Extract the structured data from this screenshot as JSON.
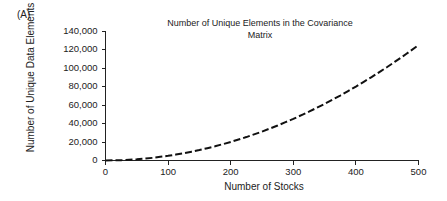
{
  "figure": {
    "panel_label": "(A)",
    "background_color": "#ffffff",
    "text_color": "#222222"
  },
  "chart_data": {
    "type": "line",
    "title": "Number of Unique Elements in the Covariance Matrix",
    "title_line1": "Number of Unique Elements in the Covariance",
    "title_line2": "Matrix",
    "xlabel": "Number of Stocks",
    "ylabel": "Number of Unique Data Elements",
    "xlim": [
      0,
      500
    ],
    "ylim": [
      0,
      140000
    ],
    "grid": false,
    "legend": "none",
    "line_style": "dashed",
    "line_color": "#111111",
    "x_ticks": [
      0,
      100,
      200,
      300,
      400,
      500
    ],
    "x_tick_labels": [
      "0",
      "100",
      "200",
      "300",
      "400",
      "500"
    ],
    "y_ticks": [
      0,
      20000,
      40000,
      60000,
      80000,
      100000,
      120000,
      140000
    ],
    "y_tick_labels": [
      "0",
      "20,000",
      "40,000",
      "60,000",
      "80,000",
      "100,000",
      "120,000",
      "140,000"
    ],
    "series": [
      {
        "name": "Unique covariance matrix elements",
        "formula": "n(n+1)/2",
        "x": [
          0,
          25,
          50,
          75,
          100,
          125,
          150,
          175,
          200,
          225,
          250,
          275,
          300,
          325,
          350,
          375,
          400,
          425,
          450,
          475,
          500
        ],
        "values": [
          0,
          325,
          1275,
          2850,
          5050,
          7875,
          11325,
          15400,
          20100,
          25425,
          31375,
          37950,
          45150,
          52975,
          61425,
          70500,
          80200,
          90525,
          101475,
          113050,
          125250
        ]
      }
    ]
  }
}
